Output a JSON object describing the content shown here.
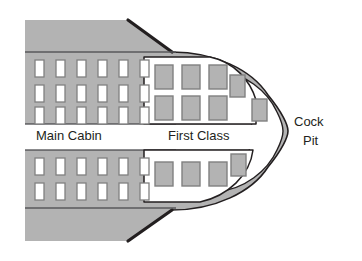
{
  "diagram": {
    "type": "floor-plan",
    "colors": {
      "fuselage_fill": "#b3b3b3",
      "fuselage_stroke": "#231f20",
      "cabin_fill": "#ffffff",
      "seat_main_fill": "#ffffff",
      "seat_main_stroke": "#808080",
      "seat_first_fill": "#b3b3b3",
      "seat_first_stroke": "#808080",
      "text": "#231f20",
      "page_background": "#ffffff"
    },
    "labels": [
      {
        "id": "main-cabin",
        "text": "Main Cabin",
        "x": 36,
        "y": 137
      },
      {
        "id": "first-class",
        "text": "First Class",
        "x": 168,
        "y": 137
      },
      {
        "id": "cockpit-line1",
        "text": "Cock",
        "x": 302,
        "y": 129
      },
      {
        "id": "cockpit-line2",
        "text": "Pit",
        "x": 310,
        "y": 147
      }
    ],
    "sections": {
      "main_cabin": {
        "name": "Main Cabin",
        "seat_class": "economy",
        "seat_style": "white",
        "upper_block": {
          "rows": 3,
          "columns": 6,
          "seat_count": 18,
          "seat_width": 9,
          "seat_height": 17,
          "col_gap": 12,
          "row_gap": 8,
          "origin_x": 35,
          "origin_y": 60
        },
        "lower_block": {
          "rows": 2,
          "columns": 6,
          "seat_count": 12,
          "seat_width": 9,
          "seat_height": 17,
          "col_gap": 12,
          "row_gap": 8,
          "origin_x": 35,
          "origin_y": 158
        },
        "total_seats": 30
      },
      "first_class": {
        "name": "First Class",
        "seat_class": "first",
        "seat_style": "gray",
        "upper_grid": {
          "rows": 2,
          "columns": 3,
          "seat_count": 6,
          "seat_width": 18,
          "seat_height": 24,
          "col_gap": 9,
          "row_gap": 7,
          "origin_x": 155,
          "origin_y": 65
        },
        "upper_offset_seats": [
          {
            "x": 230,
            "y": 75,
            "w": 15,
            "h": 22
          },
          {
            "x": 253,
            "y": 99,
            "w": 15,
            "h": 22
          }
        ],
        "lower_row": {
          "rows": 1,
          "columns": 3,
          "seat_count": 3,
          "seat_width": 18,
          "seat_height": 24,
          "col_gap": 9,
          "row_gap": 0,
          "origin_x": 155,
          "origin_y": 160
        },
        "lower_offset_seats": [
          {
            "x": 230,
            "y": 153,
            "w": 15,
            "h": 22
          }
        ],
        "total_seats": 10
      },
      "cockpit": {
        "name": "Cock Pit",
        "seat_count": 0,
        "position": "nose"
      }
    },
    "aisle": {
      "orientation": "horizontal",
      "y_center": 133,
      "height": 17
    }
  }
}
